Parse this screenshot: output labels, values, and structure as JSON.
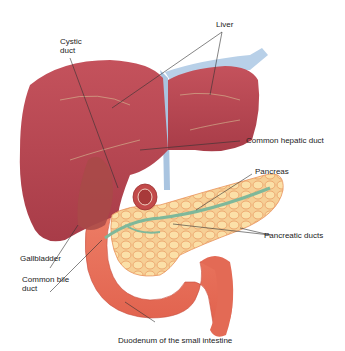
{
  "diagram": {
    "labels": [
      {
        "id": "liver",
        "text": "Liver"
      },
      {
        "id": "cystic-duct",
        "text": "Cystic\nduct"
      },
      {
        "id": "common-hepatic-duct",
        "text": "Common hepatic duct"
      },
      {
        "id": "pancreas",
        "text": "Pancreas"
      },
      {
        "id": "pancreatic-ducts",
        "text": "Pancreatic ducts"
      },
      {
        "id": "gallbladder",
        "text": "Gallbladder"
      },
      {
        "id": "common-bile-duct",
        "text": "Common bile\nduct"
      },
      {
        "id": "duodenum",
        "text": "Duodenum of the small intestine"
      }
    ],
    "colors": {
      "liver": "#b8454f",
      "liver_dark": "#9a3340",
      "vessel": "#a9c4e0",
      "pancreas": "#f5c98a",
      "pancreas_lobule": "#e8925a",
      "duct": "#7fb89a",
      "duodenum": "#e8705a",
      "gallbladder": "#a84a48",
      "leader": "#333333"
    }
  }
}
